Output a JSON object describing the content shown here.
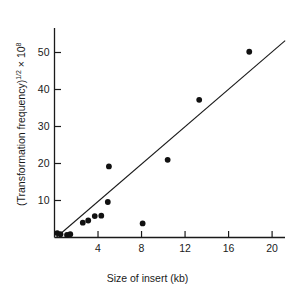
{
  "chart_data": {
    "type": "scatter",
    "title": "",
    "xlabel": "Size of insert (kb)",
    "ylabel_parts": {
      "pre": "(Transformation frequency)",
      "exp1": "1/2",
      "mid": " × 10",
      "exp2": "8"
    },
    "ylabel": "(Transformation frequency)1/2 × 108",
    "xlim": [
      0,
      21.5
    ],
    "ylim": [
      0,
      54
    ],
    "xticks": [
      4,
      8,
      12,
      16,
      20
    ],
    "xtick_labels": [
      "4",
      "8",
      "12",
      "16",
      "20"
    ],
    "yticks": [
      10,
      20,
      30,
      40,
      50
    ],
    "ytick_labels": [
      "10",
      "20",
      "30",
      "40",
      "50"
    ],
    "grid": false,
    "legend": "none",
    "marker": "filled-circle",
    "marker_color": "#111111",
    "line_color": "#1a1a1a",
    "points": [
      {
        "x": 0.25,
        "y": 1.2
      },
      {
        "x": 0.55,
        "y": 0.9
      },
      {
        "x": 1.15,
        "y": 0.7
      },
      {
        "x": 1.45,
        "y": 0.9
      },
      {
        "x": 2.6,
        "y": 4.0
      },
      {
        "x": 3.1,
        "y": 4.6
      },
      {
        "x": 3.7,
        "y": 5.8
      },
      {
        "x": 4.3,
        "y": 5.9
      },
      {
        "x": 5.0,
        "y": 19.2
      },
      {
        "x": 4.9,
        "y": 9.6
      },
      {
        "x": 8.1,
        "y": 3.8
      },
      {
        "x": 10.4,
        "y": 21.0
      },
      {
        "x": 13.3,
        "y": 37.2
      },
      {
        "x": 17.9,
        "y": 50.2
      }
    ],
    "fit_line": {
      "x1": 0.15,
      "y1": 0.0,
      "x2": 21.2,
      "y2": 53.2
    }
  },
  "axes": {
    "x_title": "Size of insert (kb)",
    "y_title": "(Transformation frequency)"
  }
}
